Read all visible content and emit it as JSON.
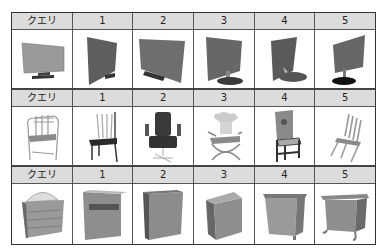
{
  "table": {
    "header_labels": [
      "クエリ",
      "1",
      "2",
      "3",
      "4",
      "5"
    ],
    "rows": [
      {
        "category": "monitor",
        "header": [
          "クエリ",
          "1",
          "2",
          "3",
          "4",
          "5"
        ],
        "images": [
          "monitor-query",
          "monitor-result-1",
          "monitor-result-2",
          "monitor-result-3",
          "monitor-result-4",
          "monitor-result-5"
        ]
      },
      {
        "category": "chair",
        "header": [
          "クエリ",
          "1",
          "2",
          "3",
          "4",
          "5"
        ],
        "images": [
          "chair-query",
          "chair-result-1",
          "chair-result-2",
          "chair-result-3",
          "chair-result-4",
          "chair-result-5"
        ]
      },
      {
        "category": "dresser",
        "header": [
          "クエリ",
          "1",
          "2",
          "3",
          "4",
          "5"
        ],
        "images": [
          "dresser-query",
          "dresser-result-1",
          "dresser-result-2",
          "dresser-result-3",
          "dresser-result-4",
          "dresser-result-5"
        ]
      }
    ]
  },
  "colors": {
    "header_bg": "#dcdcdc",
    "border": "#555555",
    "shape_light": "#9a9a9a",
    "shape_dark": "#5a5a5a"
  }
}
